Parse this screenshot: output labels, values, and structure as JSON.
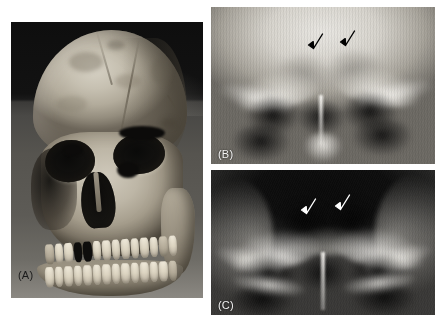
{
  "figure": {
    "background_color": "#ffffff",
    "width": 444,
    "height": 322,
    "panel_count": 3
  },
  "panels": [
    {
      "id": "A",
      "label": "(A)",
      "kind": "photograph",
      "subject": "dry human skull, anterior-oblique view",
      "label_color": "#1b1b1b",
      "label_position": "bottom-left-outside-image"
    },
    {
      "id": "B",
      "label": "(B)",
      "kind": "radiograph",
      "subject": "Caldwell / postero-anterior skull radiograph, frontal sinus region",
      "label_color": "#f2f2f2",
      "label_position": "bottom-left-inside-image",
      "exposure": "bright",
      "arrow_color": "#000000",
      "arrow_count": 2
    },
    {
      "id": "C",
      "label": "(C)",
      "kind": "radiograph",
      "subject": "Caldwell / postero-anterior skull radiograph, frontal sinus region",
      "label_color": "#f2f2f2",
      "label_position": "bottom-left-inside-image",
      "exposure": "dark",
      "arrow_color": "#ffffff",
      "arrow_count": 2
    }
  ],
  "annotations": {
    "panel_b_arrows": [
      {
        "name": "arrow-b-left",
        "direction": "down-left",
        "color": "#000000"
      },
      {
        "name": "arrow-b-right",
        "direction": "down-left",
        "color": "#000000"
      }
    ],
    "panel_c_arrows": [
      {
        "name": "arrow-c-left",
        "direction": "down-left",
        "color": "#ffffff"
      },
      {
        "name": "arrow-c-right",
        "direction": "down-left",
        "color": "#ffffff"
      }
    ]
  },
  "skull": {
    "maxillary_teeth": [
      "worn",
      "present",
      "present",
      "missing",
      "missing",
      "present",
      "present",
      "present",
      "present",
      "present",
      "present",
      "present",
      "worn",
      "present"
    ],
    "mandibular_teeth": [
      "present",
      "present",
      "present",
      "present",
      "present",
      "present",
      "present",
      "present",
      "present",
      "present",
      "present",
      "present",
      "present",
      "worn"
    ]
  },
  "colors": {
    "page_background": "#ffffff",
    "bone": "#c6c0b1",
    "photo_backdrop": "#101010",
    "photo_table": "#56544f",
    "xray_bright": "#e9e7e2",
    "xray_dark": "#0b0b0b",
    "label_dark": "#1b1b1b",
    "label_light": "#f2f2f2"
  }
}
